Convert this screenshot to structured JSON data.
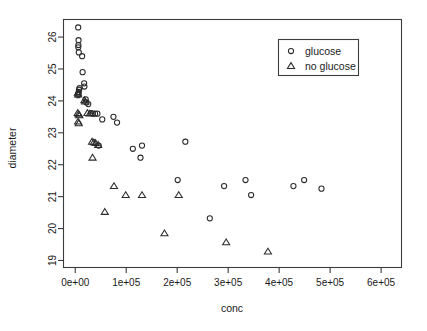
{
  "chart_data": {
    "type": "scatter",
    "title": "",
    "xlabel": "conc",
    "ylabel": "diameter",
    "xlim": [
      -23000,
      640000
    ],
    "ylim": [
      18.78,
      26.55
    ],
    "grid": false,
    "legend_position": "top-right",
    "x_ticks": [
      0,
      100000,
      200000,
      300000,
      400000,
      500000,
      600000
    ],
    "x_tick_labels": [
      "0e+00",
      "1e+05",
      "2e+05",
      "3e+05",
      "4e+05",
      "5e+05",
      "6e+05"
    ],
    "y_ticks": [
      19,
      20,
      21,
      22,
      23,
      24,
      25,
      26
    ],
    "y_tick_labels": [
      "19",
      "20",
      "21",
      "22",
      "23",
      "24",
      "25",
      "26"
    ],
    "series": [
      {
        "name": "glucose",
        "marker": "circle",
        "points": [
          [
            5800,
            26.3
          ],
          [
            6500,
            25.9
          ],
          [
            6200,
            25.75
          ],
          [
            6000,
            25.68
          ],
          [
            7000,
            25.52
          ],
          [
            13500,
            25.4
          ],
          [
            14500,
            24.9
          ],
          [
            17500,
            24.55
          ],
          [
            18000,
            24.45
          ],
          [
            8500,
            24.4
          ],
          [
            7500,
            24.35
          ],
          [
            6800,
            24.28
          ],
          [
            6200,
            24.22
          ],
          [
            5500,
            24.18
          ],
          [
            20500,
            24.05
          ],
          [
            22000,
            23.95
          ],
          [
            25500,
            23.9
          ],
          [
            31000,
            23.62
          ],
          [
            34500,
            23.6
          ],
          [
            39000,
            23.6
          ],
          [
            43500,
            23.6
          ],
          [
            53000,
            23.42
          ],
          [
            75000,
            23.5
          ],
          [
            82000,
            23.32
          ],
          [
            46000,
            22.6
          ],
          [
            113000,
            22.5
          ],
          [
            131000,
            22.6
          ],
          [
            128000,
            22.22
          ],
          [
            216000,
            22.72
          ],
          [
            201000,
            21.52
          ],
          [
            292000,
            21.33
          ],
          [
            334000,
            21.52
          ],
          [
            345000,
            21.05
          ],
          [
            428000,
            21.33
          ],
          [
            449000,
            21.52
          ],
          [
            483000,
            21.25
          ],
          [
            264000,
            20.32
          ]
        ]
      },
      {
        "name": "no glucose",
        "marker": "triangle",
        "points": [
          [
            5200,
            24.25
          ],
          [
            5800,
            24.2
          ],
          [
            5000,
            23.62
          ],
          [
            6500,
            23.58
          ],
          [
            8200,
            23.55
          ],
          [
            5600,
            23.35
          ],
          [
            7000,
            23.3
          ],
          [
            18000,
            24.02
          ],
          [
            19500,
            23.98
          ],
          [
            24000,
            23.62
          ],
          [
            28500,
            23.6
          ],
          [
            33000,
            22.72
          ],
          [
            36500,
            22.7
          ],
          [
            40000,
            22.68
          ],
          [
            45000,
            22.62
          ],
          [
            34000,
            22.22
          ],
          [
            76000,
            21.33
          ],
          [
            99000,
            21.05
          ],
          [
            131000,
            21.05
          ],
          [
            203000,
            21.05
          ],
          [
            58000,
            20.52
          ],
          [
            175000,
            19.85
          ],
          [
            296000,
            19.57
          ],
          [
            378000,
            19.28
          ]
        ]
      }
    ]
  },
  "legend": {
    "entries": [
      {
        "label": "glucose",
        "marker": "circle-icon"
      },
      {
        "label": "no glucose",
        "marker": "triangle-icon"
      }
    ]
  }
}
